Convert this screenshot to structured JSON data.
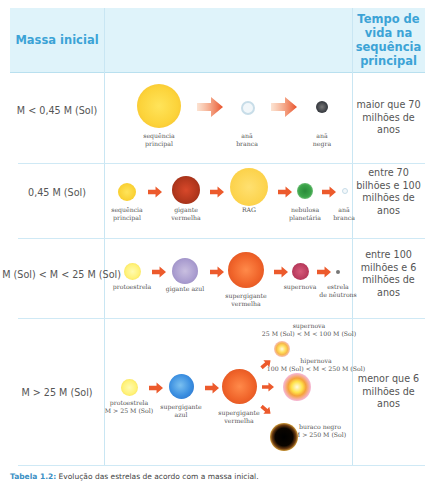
{
  "table": {
    "header": {
      "mass_label": "Massa inicial",
      "evolution_label": "",
      "lifetime_label": "Tempo de vida na sequência principal"
    },
    "colors": {
      "header_bg": "#dff3fa",
      "header_text": "#3ca3d6",
      "grid_line": "#c9e6f3",
      "arrow": "#e8502a"
    },
    "rows": [
      {
        "mass": "M < 0,45 M (Sol)",
        "lifetime": "maior que 70 milhões de anos",
        "stages": [
          {
            "label": "sequência principal",
            "icon": "yellow-star"
          },
          {
            "label": "anã branca",
            "icon": "white-dwarf"
          },
          {
            "label": "anã negra",
            "icon": "black-dwarf"
          }
        ]
      },
      {
        "mass": "0,45 M (Sol)",
        "lifetime": "entre 70 bilhões e 100 milhões de anos",
        "stages": [
          {
            "label": "sequência principal",
            "icon": "yellow-star"
          },
          {
            "label": "gigante vermelha",
            "icon": "red-giant"
          },
          {
            "label": "RAG",
            "icon": "rag-star"
          },
          {
            "label": "nebulosa planetária",
            "icon": "planetary-nebula"
          },
          {
            "label": "anã branca",
            "icon": "white-dwarf"
          }
        ]
      },
      {
        "mass": "8 M (Sol) < M < 25 M (Sol)",
        "lifetime": "entre 100 milhões e 6 milhões de anos",
        "stages": [
          {
            "label": "protoestrela",
            "icon": "protostar"
          },
          {
            "label": "gigante azul",
            "icon": "blue-giant"
          },
          {
            "label": "supergigante vermelha",
            "icon": "red-supergiant"
          },
          {
            "label": "supernova",
            "icon": "supernova"
          },
          {
            "label": "estrela de nêutrons",
            "icon": "neutron-star"
          }
        ]
      },
      {
        "mass": "M > 25 M (Sol)",
        "lifetime": "menor que 6 milhões de anos",
        "stages": [
          {
            "label": "protoestrela M > 25 M (Sol)",
            "label_line1": "protoestrela",
            "label_line2": "M > 25 M (Sol)",
            "icon": "protostar"
          },
          {
            "label": "supergigante azul",
            "label_line1": "supergigante",
            "label_line2": "azul",
            "icon": "blue-supergiant"
          },
          {
            "label": "supergigante vermelha",
            "label_line1": "supergigante",
            "label_line2": "vermelha",
            "icon": "red-supergiant"
          },
          {
            "label": "supernova 25 M (Sol) < M < 100 M (Sol)",
            "label_line1": "supernova",
            "label_line2": "25 M (Sol) < M < 100 M (Sol)",
            "icon": "supernova"
          },
          {
            "label": "hipernova 100 M (Sol) < M < 250 M (Sol)",
            "label_line1": "hipernova",
            "label_line2": "100 M (Sol) < M < 250 M (Sol)",
            "icon": "hypernova"
          },
          {
            "label": "buraco negro M > 250 M (Sol)",
            "label_line1": "buraco negro",
            "label_line2": "M > 250 M (Sol)",
            "icon": "black-hole"
          }
        ]
      }
    ]
  },
  "labels": {
    "r1": {
      "s1a": "sequência",
      "s1b": "principal",
      "s2a": "anã",
      "s2b": "branca",
      "s3a": "anã",
      "s3b": "negra"
    },
    "r2": {
      "s1a": "sequência",
      "s1b": "principal",
      "s2a": "gigante",
      "s2b": "vermelha",
      "s3a": "RAG",
      "s4a": "nebulosa",
      "s4b": "planetária",
      "s5a": "anã",
      "s5b": "branca"
    },
    "r3": {
      "s1a": "protoestrela",
      "s2a": "gigante azul",
      "s3a": "supergigante",
      "s3b": "vermelha",
      "s4a": "supernova",
      "s5a": "estrela",
      "s5b": "de nêutrons"
    }
  },
  "caption": {
    "prefix": "Tabela 1.2:",
    "text": "Evolução das estrelas de acordo com a massa inicial."
  }
}
